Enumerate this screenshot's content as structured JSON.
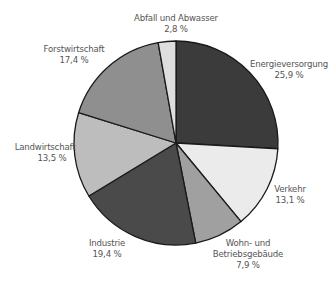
{
  "chart_data": {
    "type": "pie",
    "title": "",
    "center": [
      176,
      143
    ],
    "radius": 102,
    "start_angle_deg": -90,
    "direction": "clockwise",
    "stroke": "#1a1a1a",
    "slices": [
      {
        "label": "Energieversorgung",
        "value": 25.9,
        "value_label": "25,9 %",
        "color": "#3b3b3b"
      },
      {
        "label": "Verkehr",
        "value": 13.1,
        "value_label": "13,1 %",
        "color": "#ebebeb"
      },
      {
        "label": "Wohn- und Betriebsgebäude",
        "value": 7.9,
        "value_label": "7,9 %",
        "color": "#a0a0a0"
      },
      {
        "label": "Industrie",
        "value": 19.4,
        "value_label": "19,4 %",
        "color": "#4a4a4a"
      },
      {
        "label": "Landwirtschaft",
        "value": 13.5,
        "value_label": "13,5 %",
        "color": "#bdbdbd"
      },
      {
        "label": "Forstwirtschaft",
        "value": 17.4,
        "value_label": "17,4 %",
        "color": "#8f8f8f"
      },
      {
        "label": "Abfall und Abwasser",
        "value": 2.8,
        "value_label": "2,8 %",
        "color": "#dedede"
      }
    ],
    "labels": {
      "energie": {
        "line1": "Energieversorgung",
        "line2": "25,9 %"
      },
      "verkehr": {
        "line1": "Verkehr",
        "line2": "13,1 %"
      },
      "wohn": {
        "line1": "Wohn- und",
        "line2": "Betriebsgebäude",
        "line3": "7,9 %"
      },
      "industrie": {
        "line1": "Industrie",
        "line2": "19,4 %"
      },
      "landwirtschaft": {
        "line1": "Landwirtschaft",
        "line2": "13,5 %"
      },
      "forst": {
        "line1": "Forstwirtschaft",
        "line2": "17,4 %"
      },
      "abfall": {
        "line1": "Abfall und Abwasser",
        "line2": "2,8 %"
      }
    },
    "legend": "none"
  }
}
